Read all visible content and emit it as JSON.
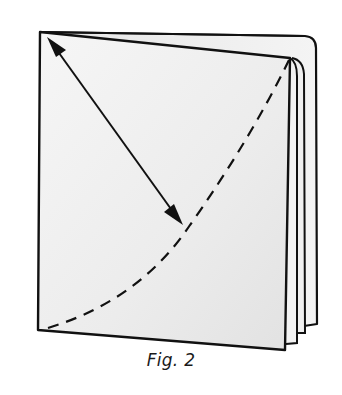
{
  "figure": {
    "caption": "Fig. 2",
    "colors": {
      "background": "#ffffff",
      "paper": "#f2f2f2",
      "paper_shade": "#e4e4e4",
      "ink": "#111111"
    },
    "elements": {
      "front_page": "front-page",
      "back_pages": 3,
      "arrow": "double-headed-arrow",
      "fold_line": "dashed-curve"
    }
  }
}
